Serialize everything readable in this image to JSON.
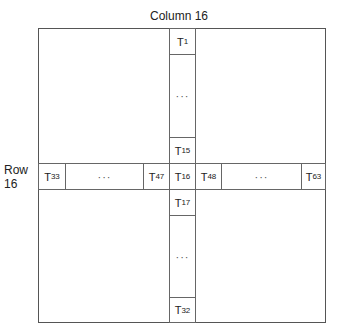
{
  "diagram": {
    "column_label": "Column 16",
    "row_label_line1": "Row",
    "row_label_line2": "16",
    "column_cells": [
      {
        "base": "T",
        "sub": "1"
      },
      {
        "ellipsis": "···"
      },
      {
        "base": "T",
        "sub": "15"
      },
      {
        "base": "T",
        "sub": "16"
      },
      {
        "base": "T",
        "sub": "17"
      },
      {
        "ellipsis": "···"
      },
      {
        "base": "T",
        "sub": "32"
      }
    ],
    "row_cells": [
      {
        "base": "T",
        "sub": "33"
      },
      {
        "ellipsis": "···"
      },
      {
        "base": "T",
        "sub": "47"
      },
      {
        "base": "T",
        "sub": "16"
      },
      {
        "base": "T",
        "sub": "48"
      },
      {
        "ellipsis": "···"
      },
      {
        "base": "T",
        "sub": "63"
      }
    ],
    "line_color": "#555555"
  }
}
